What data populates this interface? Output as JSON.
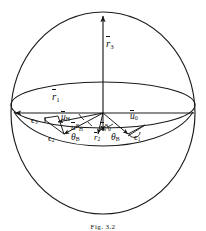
{
  "figure": {
    "type": "geometry-diagram",
    "caption": "Fig. 3.2",
    "stroke_color": "#1a1a1a",
    "background": "#ffffff",
    "sphere": {
      "cx": 103,
      "cy": 113,
      "rx": 92,
      "ry": 101
    },
    "equator": {
      "cx": 103,
      "cy": 105,
      "rx": 92,
      "ry": 23
    },
    "center_vertex": {
      "x": 103,
      "y": 113
    }
  },
  "axes": [
    {
      "name": "r3",
      "base": "r",
      "sub": "3",
      "label_x": 106,
      "label_y": 44,
      "direction": "up"
    },
    {
      "name": "r1",
      "base": "r",
      "sub": "1",
      "label_x": 52,
      "label_y": 97,
      "direction": "left"
    },
    {
      "name": "r2",
      "base": "r",
      "sub": "2",
      "label_x": 96,
      "label_y": 137,
      "direction": "down"
    }
  ],
  "vectors": [
    {
      "name": "uH",
      "base": "u",
      "sub": "H",
      "sup": "",
      "label_x": 64,
      "label_y": 118
    },
    {
      "name": "uHB",
      "base": "u",
      "sub": "H",
      "sup": "B",
      "label_x": 74,
      "label_y": 128
    },
    {
      "name": "u0B",
      "base": "u",
      "sub": "0",
      "sup": "B",
      "label_x": 103,
      "label_y": 128
    },
    {
      "name": "u0",
      "base": "u",
      "sub": "0",
      "sup": "",
      "label_x": 133,
      "label_y": 117
    }
  ],
  "angles": [
    {
      "name": "thetaB-left",
      "symbol": "θ",
      "sub": "B",
      "label_x": 74,
      "label_y": 139
    },
    {
      "name": "thetaB-right",
      "symbol": "θ",
      "sub": "B",
      "label_x": 113,
      "label_y": 139
    }
  ],
  "epsilons": [
    {
      "name": "eps3",
      "symbol": "ϵ",
      "sub": "3",
      "label_x": 33,
      "label_y": 122
    },
    {
      "name": "eps2",
      "symbol": "ϵ",
      "sub": "2",
      "label_x": 50,
      "label_y": 140
    },
    {
      "name": "eps1",
      "symbol": "ϵ",
      "sub": "1",
      "label_x": 137,
      "label_y": 139
    }
  ]
}
